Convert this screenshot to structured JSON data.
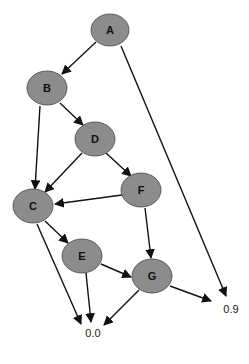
{
  "diagram": {
    "type": "directed-graph",
    "nodes": [
      {
        "id": "A",
        "label": "A",
        "x": 110,
        "y": 30
      },
      {
        "id": "B",
        "label": "B",
        "x": 47,
        "y": 88
      },
      {
        "id": "D",
        "label": "D",
        "x": 95,
        "y": 139
      },
      {
        "id": "F",
        "label": "F",
        "x": 141,
        "y": 190
      },
      {
        "id": "C",
        "label": "C",
        "x": 33,
        "y": 206
      },
      {
        "id": "E",
        "label": "E",
        "x": 82,
        "y": 256
      },
      {
        "id": "G",
        "label": "G",
        "x": 152,
        "y": 276
      }
    ],
    "leaves": [
      {
        "id": "zero",
        "label": "0.0",
        "x": 93,
        "y": 337
      },
      {
        "id": "nine",
        "label": "0.9",
        "x": 231,
        "y": 313
      }
    ],
    "edges": [
      {
        "from": "A",
        "to": "B"
      },
      {
        "from": "A",
        "to": "nine"
      },
      {
        "from": "B",
        "to": "D"
      },
      {
        "from": "B",
        "to": "C"
      },
      {
        "from": "D",
        "to": "C"
      },
      {
        "from": "D",
        "to": "F"
      },
      {
        "from": "F",
        "to": "C"
      },
      {
        "from": "F",
        "to": "G"
      },
      {
        "from": "C",
        "to": "E"
      },
      {
        "from": "C",
        "to": "zero"
      },
      {
        "from": "E",
        "to": "G"
      },
      {
        "from": "E",
        "to": "zero"
      },
      {
        "from": "G",
        "to": "zero"
      },
      {
        "from": "G",
        "to": "nine"
      }
    ],
    "colors": {
      "node_fill": "#8c8c8c",
      "edge": "#111111"
    }
  }
}
